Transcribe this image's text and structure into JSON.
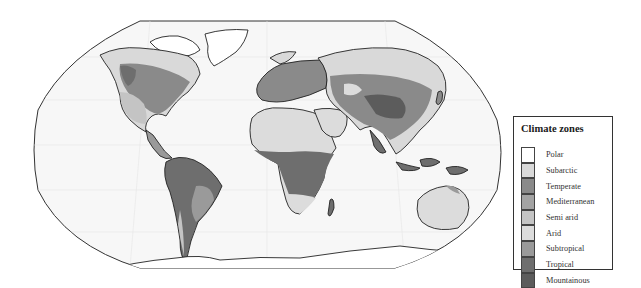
{
  "legend": {
    "title": "Climate zones",
    "items": [
      {
        "label": "Polar",
        "color": "#ffffff"
      },
      {
        "label": "Subarctic",
        "color": "#d9d9d9"
      },
      {
        "label": "Temperate",
        "color": "#8a8a8a"
      },
      {
        "label": "Mediterranean",
        "color": "#a3a3a3"
      },
      {
        "label": "Semi arid",
        "color": "#c4c4c4"
      },
      {
        "label": "Arid",
        "color": "#dcdcdc"
      },
      {
        "label": "Subtropical",
        "color": "#9a9a9a"
      },
      {
        "label": "Tropical",
        "color": "#6e6e6e"
      },
      {
        "label": "Mountainous",
        "color": "#5c5c5c"
      }
    ]
  },
  "map": {
    "projection": "world-robinson-outline",
    "ocean_color": "#f7f7f7",
    "outline_color": "#333333"
  }
}
